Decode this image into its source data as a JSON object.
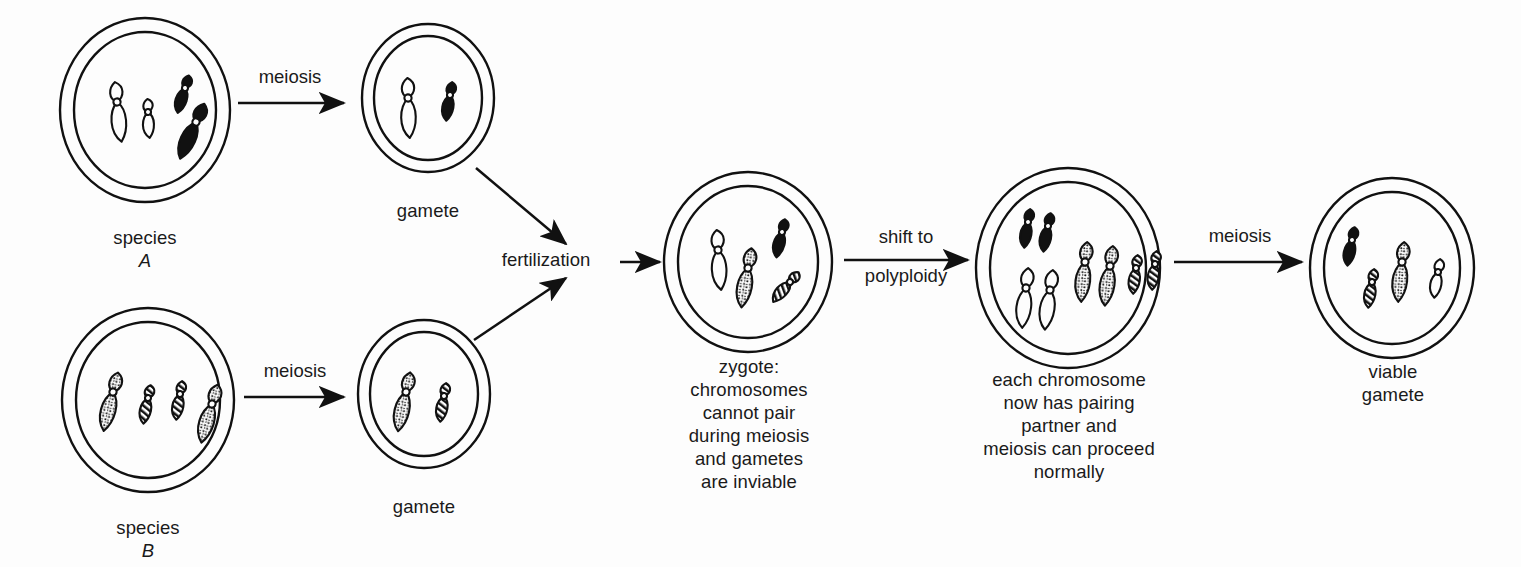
{
  "figure": {
    "background_color": "#fdfdfd",
    "ink_color": "#111111"
  },
  "labels": {
    "species_a": "species",
    "species_a_name": "A",
    "species_b": "species",
    "species_b_name": "B",
    "gamete_a": "gamete",
    "gamete_b": "gamete",
    "zygote": "zygote:\nchromosomes\ncannot pair\nduring meiosis\nand gametes\nare inviable",
    "polyploid": "each chromosome\nnow has pairing\npartner and\nmeiosis can proceed\nnormally",
    "viable_gamete": "viable\ngamete"
  },
  "arrows": {
    "meiosis_top": "meiosis",
    "meiosis_bottom": "meiosis",
    "fertilization": "fertilization",
    "shift_top": "shift to",
    "shift_bottom": "polyploidy",
    "meiosis_final": "meiosis"
  },
  "chart_data": {
    "type": "diagram",
    "chromosome_styles": {
      "white": "outline only, unfilled",
      "black": "solid black fill",
      "stippled": "dotted / stippled fill",
      "hatched": "diagonal line hatching"
    },
    "cells": [
      {
        "id": "species-a",
        "label": "species A",
        "cx": 145,
        "cy": 110,
        "rx": 85,
        "ry": 92,
        "chromosomes": [
          {
            "style": "white",
            "size": "large",
            "x": 117,
            "y": 102,
            "rot": -8
          },
          {
            "style": "white",
            "size": "small",
            "x": 148,
            "y": 112,
            "rot": -6
          },
          {
            "style": "black",
            "size": "small",
            "x": 185,
            "y": 88,
            "rot": 14
          },
          {
            "style": "black",
            "size": "large",
            "x": 196,
            "y": 122,
            "rot": 22
          }
        ]
      },
      {
        "id": "gamete-a",
        "label": "gamete",
        "cx": 428,
        "cy": 98,
        "rx": 66,
        "ry": 74,
        "chromosomes": [
          {
            "style": "white",
            "size": "large",
            "x": 408,
            "y": 98,
            "rot": -4
          },
          {
            "style": "black",
            "size": "small",
            "x": 450,
            "y": 95,
            "rot": 6
          }
        ]
      },
      {
        "id": "species-b",
        "label": "species B",
        "cx": 148,
        "cy": 400,
        "rx": 86,
        "ry": 92,
        "chromosomes": [
          {
            "style": "stippled",
            "size": "large",
            "x": 113,
            "y": 392,
            "rot": 12
          },
          {
            "style": "hatched",
            "size": "small",
            "x": 148,
            "y": 398,
            "rot": 8
          },
          {
            "style": "hatched",
            "size": "small",
            "x": 180,
            "y": 394,
            "rot": 6
          },
          {
            "style": "stippled",
            "size": "large",
            "x": 212,
            "y": 404,
            "rot": 14
          }
        ]
      },
      {
        "id": "gamete-b",
        "label": "gamete",
        "cx": 424,
        "cy": 394,
        "rx": 66,
        "ry": 74,
        "chromosomes": [
          {
            "style": "stippled",
            "size": "large",
            "x": 406,
            "y": 392,
            "rot": 10
          },
          {
            "style": "hatched",
            "size": "small",
            "x": 444,
            "y": 396,
            "rot": 6
          }
        ]
      },
      {
        "id": "zygote",
        "label": "zygote",
        "cx": 748,
        "cy": 262,
        "rx": 84,
        "ry": 90,
        "chromosomes": [
          {
            "style": "white",
            "size": "large",
            "x": 718,
            "y": 250,
            "rot": -6
          },
          {
            "style": "stippled",
            "size": "large",
            "x": 748,
            "y": 268,
            "rot": 8
          },
          {
            "style": "black",
            "size": "small",
            "x": 782,
            "y": 232,
            "rot": 10
          },
          {
            "style": "hatched",
            "size": "small",
            "x": 790,
            "y": 282,
            "rot": 38
          }
        ]
      },
      {
        "id": "polyploid",
        "label": "polyploid cell",
        "cx": 1068,
        "cy": 268,
        "rx": 92,
        "ry": 100,
        "chromosomes": [
          {
            "style": "black",
            "size": "small",
            "x": 1028,
            "y": 222,
            "rot": 6
          },
          {
            "style": "black",
            "size": "small",
            "x": 1048,
            "y": 226,
            "rot": 8
          },
          {
            "style": "white",
            "size": "large",
            "x": 1026,
            "y": 288,
            "rot": 4
          },
          {
            "style": "white",
            "size": "large",
            "x": 1050,
            "y": 290,
            "rot": 6
          },
          {
            "style": "stippled",
            "size": "large",
            "x": 1085,
            "y": 262,
            "rot": 4
          },
          {
            "style": "stippled",
            "size": "large",
            "x": 1110,
            "y": 266,
            "rot": 6
          },
          {
            "style": "hatched",
            "size": "small",
            "x": 1136,
            "y": 268,
            "rot": 4
          },
          {
            "style": "hatched",
            "size": "small",
            "x": 1155,
            "y": 264,
            "rot": 4
          }
        ]
      },
      {
        "id": "viable-gamete",
        "label": "viable gamete",
        "cx": 1392,
        "cy": 268,
        "rx": 82,
        "ry": 90,
        "chromosomes": [
          {
            "style": "black",
            "size": "small",
            "x": 1352,
            "y": 240,
            "rot": 8
          },
          {
            "style": "hatched",
            "size": "small",
            "x": 1372,
            "y": 282,
            "rot": 6
          },
          {
            "style": "stippled",
            "size": "large",
            "x": 1402,
            "y": 262,
            "rot": 4
          },
          {
            "style": "white",
            "size": "small",
            "x": 1438,
            "y": 272,
            "rot": 6
          }
        ]
      }
    ],
    "connections": [
      {
        "from": "species-a",
        "to": "gamete-a",
        "label": "meiosis"
      },
      {
        "from": "species-b",
        "to": "gamete-b",
        "label": "meiosis"
      },
      {
        "from": "gamete-a",
        "to": "zygote",
        "label": "fertilization"
      },
      {
        "from": "gamete-b",
        "to": "zygote",
        "label": "fertilization"
      },
      {
        "from": "zygote",
        "to": "polyploid",
        "label": "shift to polyploidy"
      },
      {
        "from": "polyploid",
        "to": "viable-gamete",
        "label": "meiosis"
      }
    ]
  }
}
